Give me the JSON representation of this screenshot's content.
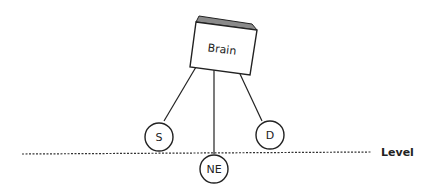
{
  "diagram": {
    "brain": {
      "label": "Brain",
      "fill": "#ffffff",
      "top_fill": "#8a8a8a"
    },
    "nodes": [
      {
        "id": "S",
        "label": "S"
      },
      {
        "id": "NE",
        "label": "NE"
      },
      {
        "id": "D",
        "label": "D"
      }
    ],
    "level_line": {
      "label": "Level"
    }
  }
}
